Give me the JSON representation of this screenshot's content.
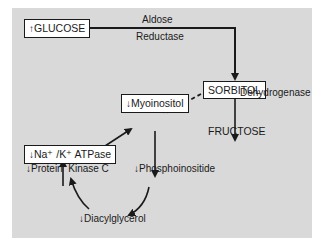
{
  "nodes": {
    "glucose": {
      "arrow": "↑",
      "label": "GLUCOSE"
    },
    "sorbitol": {
      "label": "SORBITOL"
    },
    "fructose": {
      "label": "FRUCTOSE"
    },
    "myoinositol": {
      "arrow": "↓",
      "label": "Myoinositol"
    },
    "atpase": {
      "arrow": "↓",
      "label": "Na⁺ /K⁺ ATPase"
    },
    "pkc": {
      "arrow": "↓",
      "label": "Protein  Kinase C"
    },
    "phosphoinositide": {
      "arrow": "↓",
      "label": "Phosphoinositide"
    },
    "diacylglycerol": {
      "arrow": "↓",
      "label": "Diacylglycerol"
    }
  },
  "enzymes": {
    "aldose_line1": "Aldose",
    "aldose_line2": "Reductase",
    "dehydrogenase": "Dehydrogenase"
  },
  "colors": {
    "panel": "#d9d9d9",
    "line": "#1a1a1a",
    "box": "#ffffff"
  }
}
